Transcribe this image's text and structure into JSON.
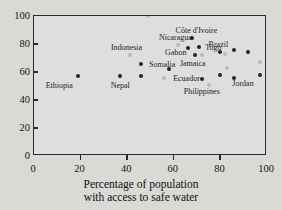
{
  "chart_data": {
    "type": "scatter",
    "title": "",
    "xlabel": "Percentage of population with access to safe water",
    "xlabel_line1": "Percentage of population",
    "xlabel_line2": "with access to safe water",
    "ylabel": "",
    "xlim": [
      0,
      100
    ],
    "ylim": [
      0,
      100
    ],
    "xticks": [
      0,
      20,
      40,
      60,
      80,
      100
    ],
    "yticks": [
      0,
      20,
      40,
      60,
      80,
      100
    ],
    "grid": false,
    "legend": "none",
    "point_color_dark": "#232323",
    "point_color_light": "#b9b9b9",
    "frame_color": "#2a2a2a",
    "background": "#d9d9d5",
    "plot_background": "#dedede",
    "points": [
      {
        "label": "Ethiopia",
        "x": 19,
        "y": 57,
        "shade": "dark",
        "label_dx": -19,
        "label_dy": 9
      },
      {
        "label": "Indonesia",
        "x": 41,
        "y": 72,
        "shade": "light",
        "label_dx": -3,
        "label_dy": -8
      },
      {
        "label": "Somalia",
        "x": 46,
        "y": 66,
        "shade": "dark",
        "label_dx": 21,
        "label_dy": 0
      },
      {
        "label": "Nepal",
        "x": 37,
        "y": 57,
        "shade": "dark",
        "label_dx": 0,
        "label_dy": 9
      },
      {
        "label": "",
        "x": 46,
        "y": 57,
        "shade": "dark",
        "label_dx": 0,
        "label_dy": 0
      },
      {
        "label": "Ecuador",
        "x": 56,
        "y": 56,
        "shade": "light",
        "label_dx": 22,
        "label_dy": 0
      },
      {
        "label": "",
        "x": 58,
        "y": 62,
        "shade": "dark",
        "label_dx": 0,
        "label_dy": 0
      },
      {
        "label": "Nicaragua",
        "x": 62,
        "y": 79,
        "shade": "light",
        "label_dx": -3,
        "label_dy": -8
      },
      {
        "label": "Côte d'Ivoire",
        "x": 68,
        "y": 84,
        "shade": "dark",
        "label_dx": 4,
        "label_dy": -8
      },
      {
        "label": "Gabon",
        "x": 66,
        "y": 77,
        "shade": "dark",
        "label_dx": -12,
        "label_dy": 4
      },
      {
        "label": "Togo",
        "x": 71,
        "y": 78,
        "shade": "dark",
        "label_dx": 14,
        "label_dy": 0
      },
      {
        "label": "Jamaica",
        "x": 69,
        "y": 72,
        "shade": "dark",
        "label_dx": -2,
        "label_dy": 8
      },
      {
        "label": "",
        "x": 72,
        "y": 72,
        "shade": "light",
        "label_dx": 0,
        "label_dy": 0
      },
      {
        "label": "Philippines",
        "x": 72,
        "y": 55,
        "shade": "dark",
        "label_dx": 0,
        "label_dy": 12
      },
      {
        "label": "",
        "x": 75,
        "y": 51,
        "shade": "light",
        "label_dx": 0,
        "label_dy": 0
      },
      {
        "label": "Brazil",
        "x": 80,
        "y": 74,
        "shade": "dark",
        "label_dx": -2,
        "label_dy": -8
      },
      {
        "label": "",
        "x": 82,
        "y": 73,
        "shade": "light",
        "label_dx": 0,
        "label_dy": 0
      },
      {
        "label": "",
        "x": 80,
        "y": 58,
        "shade": "dark",
        "label_dx": 0,
        "label_dy": 0
      },
      {
        "label": "",
        "x": 83,
        "y": 63,
        "shade": "light",
        "label_dx": 0,
        "label_dy": 0
      },
      {
        "label": "",
        "x": 86,
        "y": 76,
        "shade": "dark",
        "label_dx": 0,
        "label_dy": 0
      },
      {
        "label": "",
        "x": 86,
        "y": 56,
        "shade": "dark",
        "label_dx": 0,
        "label_dy": 0
      },
      {
        "label": "Jordan",
        "x": 97,
        "y": 58,
        "shade": "dark",
        "label_dx": -17,
        "label_dy": 8
      },
      {
        "label": "",
        "x": 92,
        "y": 74,
        "shade": "dark",
        "label_dx": 0,
        "label_dy": 0
      },
      {
        "label": "",
        "x": 97,
        "y": 67,
        "shade": "light",
        "label_dx": 0,
        "label_dy": 0
      },
      {
        "label": "",
        "x": 49,
        "y": 100,
        "shade": "light",
        "label_dx": 0,
        "label_dy": 0
      }
    ]
  }
}
